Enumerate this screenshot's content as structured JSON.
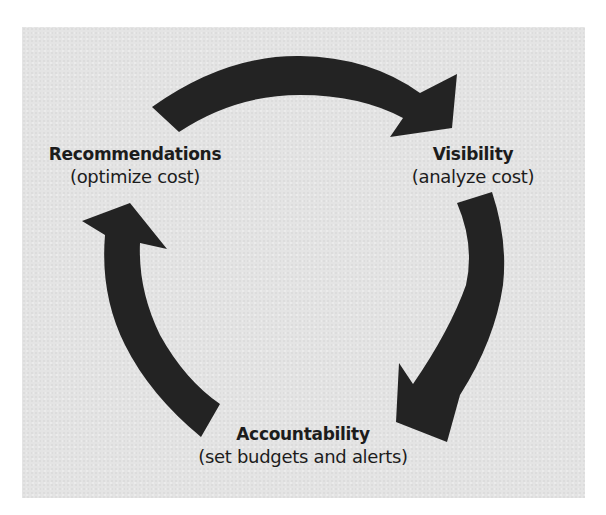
{
  "diagram": {
    "type": "cycle",
    "background_color": "#e4e4e4",
    "arrow_color": "#232323",
    "text_color": "#1c1c1c",
    "nodes": [
      {
        "id": "recommendations",
        "title": "Recommendations",
        "subtitle": "(optimize cost)",
        "position": "top-left"
      },
      {
        "id": "visibility",
        "title": "Visibility",
        "subtitle": "(analyze cost)",
        "position": "top-right"
      },
      {
        "id": "accountability",
        "title": "Accountability",
        "subtitle": "(set budgets and alerts)",
        "position": "bottom-center"
      }
    ],
    "edges": [
      {
        "from": "recommendations",
        "to": "visibility",
        "shape": "curved-arrow"
      },
      {
        "from": "visibility",
        "to": "accountability",
        "shape": "curved-arrow"
      },
      {
        "from": "accountability",
        "to": "recommendations",
        "shape": "curved-arrow"
      }
    ]
  }
}
